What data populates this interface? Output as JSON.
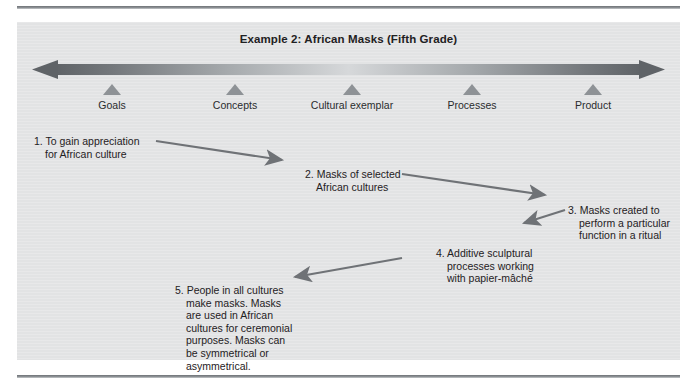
{
  "figure": {
    "title": "Example 2: African Masks (Fifth Grade)",
    "continuum": {
      "left_arrow_icon": "arrow-left-icon",
      "right_arrow_icon": "arrow-right-icon",
      "bar_color_dark": "#6b6f73",
      "bar_color_light": "#d2d4d6"
    },
    "stages": [
      {
        "label": "Goals",
        "x": 95
      },
      {
        "label": "Concepts",
        "x": 218
      },
      {
        "label": "Cultural exemplar",
        "x": 335
      },
      {
        "label": "Processes",
        "x": 455
      },
      {
        "label": "Product",
        "x": 576
      }
    ],
    "notes": [
      {
        "id": "note-1",
        "text": "1. To gain appreciation\n    for African culture",
        "x": 17,
        "y": 113,
        "width": 160
      },
      {
        "id": "note-2",
        "text": "2. Masks of selected\n    African cultures",
        "x": 288,
        "y": 146,
        "width": 145
      },
      {
        "id": "note-3",
        "text": "3. Masks created to\n    perform a particular\n    function in a ritual",
        "x": 551,
        "y": 182,
        "width": 135
      },
      {
        "id": "note-4",
        "text": "4. Additive sculptural\n    processes working\n    with papier-mâché",
        "x": 419,
        "y": 225,
        "width": 145
      },
      {
        "id": "note-5",
        "text": "5. People in all cultures\n    make masks. Masks\n    are used in African\n    cultures for ceremonial\n    purposes. Masks can\n    be symmetrical or\n    asymmetrical.",
        "x": 158,
        "y": 262,
        "width": 145
      }
    ],
    "connectors": [
      {
        "id": "connector-1-to-2",
        "from_note": "note-1",
        "to_note": "note-2",
        "x1": 139,
        "y1": 119,
        "x2": 271,
        "y2": 139
      },
      {
        "id": "connector-2-to-3",
        "from_note": "note-2",
        "to_note": "note-3",
        "x1": 385,
        "y1": 152,
        "x2": 534,
        "y2": 174
      },
      {
        "id": "connector-3-to-4",
        "from_note": "note-3",
        "to_note": "note-4",
        "x1": 548,
        "y1": 188,
        "x2": 502,
        "y2": 203
      },
      {
        "id": "connector-4-to-5",
        "from_note": "note-4",
        "to_note": "note-5",
        "x1": 385,
        "y1": 236,
        "x2": 272,
        "y2": 256
      }
    ],
    "colors": {
      "panel_background": "#e3e4e5",
      "marker": "#8e9296",
      "connector": "#6f7276",
      "text": "#1f2123",
      "rule": "#7e8286"
    }
  }
}
